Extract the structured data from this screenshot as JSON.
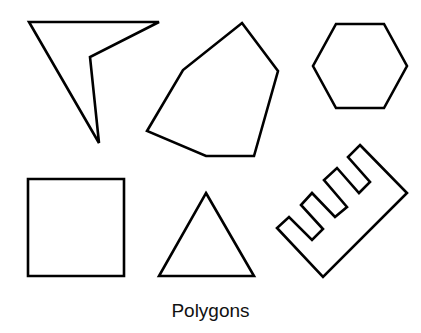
{
  "caption": "Polygons",
  "shapes": [
    {
      "name": "concave-quadrilateral",
      "points": "29,22 159,22 90,57 99,143"
    },
    {
      "name": "irregular-hexagon",
      "points": "242,23 278,71 254,156 206,156 147,131 183,70"
    },
    {
      "name": "regular-hexagon",
      "points": "336,24 384,24 407,66 384,108 336,108 313,66"
    },
    {
      "name": "square",
      "points": "28,179 124,179 124,276 28,276"
    },
    {
      "name": "triangle",
      "points": "206,193 254,276 159,276"
    },
    {
      "name": "comb-polygon",
      "points": "360,145 407,193 323,277 277,228 289,217 312,240 323,229 301,205 312,193 335,217 347,207 324,180 337,168 359,193 370,182 348,157"
    }
  ]
}
